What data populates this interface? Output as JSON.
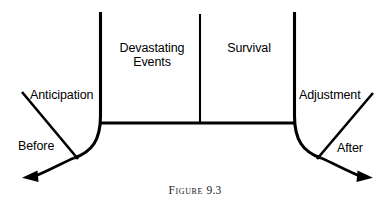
{
  "figure": {
    "caption_word": "Figure",
    "caption_number": "9.3",
    "caption_full": "Figure 9.3"
  },
  "diagram": {
    "type": "timeline-phase-diagram",
    "background_color": "#ffffff",
    "line_color": "#000000",
    "phases": [
      {
        "name": "devastating-events",
        "label": "Devastating Events",
        "label_lines": [
          "Devastating",
          "Events"
        ]
      },
      {
        "name": "survival",
        "label": "Survival",
        "label_lines": [
          "Survival"
        ]
      }
    ],
    "flanking_labels": [
      {
        "name": "anticipation",
        "label": "Anticipation",
        "side": "left"
      },
      {
        "name": "adjustment",
        "label": "Adjustment",
        "side": "right"
      }
    ],
    "time_labels": [
      {
        "name": "before",
        "label": "Before",
        "side": "left"
      },
      {
        "name": "after",
        "label": "After",
        "side": "right"
      }
    ],
    "arrows": [
      {
        "name": "before-arrow",
        "direction": "left",
        "description": "curved arrow sweeping down and out to the left"
      },
      {
        "name": "after-arrow",
        "direction": "right",
        "description": "curved arrow sweeping down and out to the right"
      }
    ],
    "dividers": [
      {
        "name": "left-divider",
        "orientation": "vertical"
      },
      {
        "name": "middle-divider",
        "orientation": "vertical"
      },
      {
        "name": "right-divider",
        "orientation": "vertical"
      },
      {
        "name": "baseline",
        "orientation": "horizontal"
      }
    ]
  }
}
